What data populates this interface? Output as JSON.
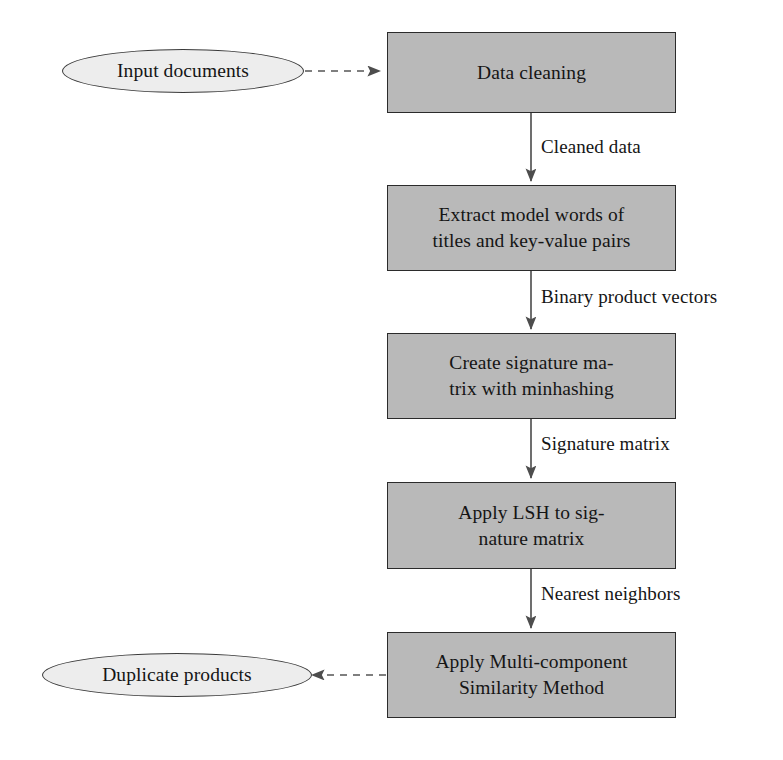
{
  "diagram": {
    "colors": {
      "box_fill": "#b9b9b9",
      "box_stroke": "#2b2b2b",
      "ellipse_fill": "#ededed",
      "ellipse_stroke": "#3a3a3a",
      "connector": "#555555",
      "text": "#151515",
      "background": "#ffffff"
    },
    "terminators": [
      {
        "id": "input-documents",
        "label": "Input documents"
      },
      {
        "id": "duplicate-products",
        "label": "Duplicate products"
      }
    ],
    "steps": [
      {
        "id": "data-cleaning",
        "label": "Data cleaning"
      },
      {
        "id": "extract-model-words",
        "label": "Extract model words of\ntitles and key-value pairs"
      },
      {
        "id": "create-signature-matrix",
        "label": "Create signature ma-\ntrix with minhashing"
      },
      {
        "id": "apply-lsh",
        "label": "Apply LSH to sig-\nnature matrix"
      },
      {
        "id": "apply-msm",
        "label": "Apply Multi-component\nSimilarity Method"
      }
    ],
    "edge_labels": [
      {
        "id": "cleaned-data",
        "label": "Cleaned data"
      },
      {
        "id": "binary-product-vectors",
        "label": "Binary product vectors"
      },
      {
        "id": "signature-matrix",
        "label": "Signature matrix"
      },
      {
        "id": "nearest-neighbors",
        "label": "Nearest neighbors"
      }
    ],
    "connectors": [
      {
        "id": "input-to-cleaning",
        "style": "dashed",
        "direction": "right"
      },
      {
        "id": "cleaning-to-extract",
        "style": "solid",
        "direction": "down"
      },
      {
        "id": "extract-to-signature",
        "style": "solid",
        "direction": "down"
      },
      {
        "id": "signature-to-lsh",
        "style": "solid",
        "direction": "down"
      },
      {
        "id": "lsh-to-msm",
        "style": "solid",
        "direction": "down"
      },
      {
        "id": "msm-to-duplicates",
        "style": "dashed",
        "direction": "left"
      }
    ]
  }
}
